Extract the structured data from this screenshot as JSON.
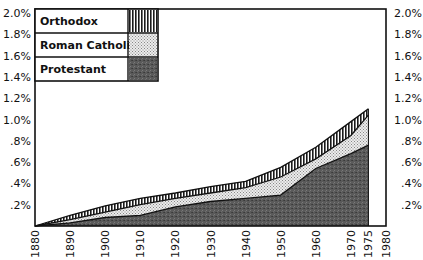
{
  "chart_data": {
    "type": "area",
    "stacked": true,
    "title": "",
    "xlabel": "",
    "ylabel": "",
    "x": [
      1880,
      1890,
      1900,
      1910,
      1920,
      1930,
      1940,
      1950,
      1960,
      1970,
      1975
    ],
    "series": [
      {
        "name": "Protestant",
        "pattern": "dark-stipple",
        "color": "#555555",
        "values": [
          0.0,
          0.03,
          0.08,
          0.1,
          0.18,
          0.23,
          0.26,
          0.29,
          0.54,
          0.68,
          0.76
        ]
      },
      {
        "name": "Roman Catholic",
        "pattern": "light-dots",
        "color": "#d8d8d8",
        "values": [
          0.0,
          0.03,
          0.05,
          0.1,
          0.08,
          0.08,
          0.1,
          0.17,
          0.09,
          0.17,
          0.28
        ]
      },
      {
        "name": "Orthodox",
        "pattern": "vertical-lines",
        "color": "#222222",
        "values": [
          0.0,
          0.04,
          0.06,
          0.06,
          0.05,
          0.06,
          0.06,
          0.09,
          0.11,
          0.13,
          0.06
        ]
      }
    ],
    "cumulative_totals": [
      0.0,
      0.1,
      0.19,
      0.26,
      0.31,
      0.37,
      0.42,
      0.55,
      0.74,
      0.98,
      1.1
    ],
    "units": "%",
    "xlim": [
      1880,
      1980
    ],
    "ylim": [
      0,
      2.0
    ],
    "x_ticks": [
      "1880",
      "1890",
      "1900",
      "1910",
      "1920",
      "1930",
      "1940",
      "1950",
      "1960",
      "1970",
      "1975",
      "1980"
    ],
    "y_ticks_left": [
      "2.0%",
      "1.8%",
      "1.6%",
      "1.4%",
      "1.2%",
      "1.0%",
      ".8%",
      ".6%",
      ".4%",
      ".2%"
    ],
    "y_ticks_right": [
      "2.0%",
      "1.8%",
      "1.6%",
      "1.4%",
      "1.2%",
      "1.0%",
      ".8%",
      ".6%",
      ".4%",
      ".2%"
    ],
    "legend": {
      "position": "top-left",
      "entries": [
        "Orthodox",
        "Roman Catholic",
        "Protestant"
      ]
    },
    "grid": false
  }
}
